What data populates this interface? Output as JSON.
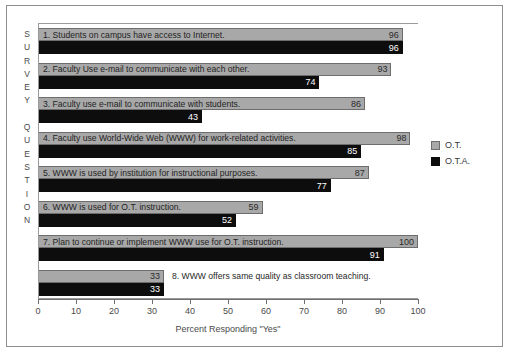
{
  "chart_data": {
    "type": "bar",
    "orientation": "horizontal",
    "title": "",
    "xlabel": "Percent Responding \"Yes\"",
    "ylabel": "SURVEY QUESTION",
    "xlim": [
      0,
      100
    ],
    "xticks": [
      0,
      10,
      20,
      30,
      40,
      50,
      60,
      70,
      80,
      90,
      100
    ],
    "grid": false,
    "legend_position": "right",
    "categories": [
      "1. Students on campus have access to Internet.",
      "2. Faculty Use e-mail to communicate with each other.",
      "3. Faculty use e-mail to communicate with students.",
      "4. Faculty use World-Wide Web (WWW) for work-related activities.",
      "5. WWW is used by institution for instructional purposes.",
      "6. WWW is used for O.T. instruction.",
      "7. Plan to continue or implement WWW use for O.T. instruction.",
      "8. WWW offers same quality as classroom teaching."
    ],
    "series": [
      {
        "name": "O.T.",
        "color": "#a8a8a8",
        "values": [
          96,
          93,
          86,
          98,
          87,
          59,
          100,
          33
        ]
      },
      {
        "name": "O.T.A.",
        "color": "#0d0d0d",
        "values": [
          96,
          74,
          43,
          85,
          77,
          52,
          91,
          33
        ]
      }
    ]
  },
  "axis": {
    "y_caption_letters": [
      "S",
      "U",
      "R",
      "V",
      "E",
      "Y",
      "",
      "Q",
      "U",
      "E",
      "S",
      "T",
      "I",
      "O",
      "N"
    ],
    "x_title": "Percent Responding \"Yes\"",
    "x_tick_labels": [
      "0",
      "10",
      "20",
      "30",
      "40",
      "50",
      "60",
      "70",
      "80",
      "90",
      "100"
    ]
  },
  "legend": {
    "items": [
      {
        "label": "O.T.",
        "swatch": "ot"
      },
      {
        "label": "O.T.A.",
        "swatch": "ota"
      }
    ]
  },
  "bars": [
    {
      "index": 0,
      "caption": "1.  Students on campus have access to Internet.",
      "caption_inside": true,
      "ot": 96,
      "ota": 96,
      "ot_label": "96",
      "ota_label": "96"
    },
    {
      "index": 1,
      "caption": "2.  Faculty Use e-mail to communicate with each other.",
      "caption_inside": true,
      "ot": 93,
      "ota": 74,
      "ot_label": "93",
      "ota_label": "74"
    },
    {
      "index": 2,
      "caption": "3.  Faculty use e-mail to communicate with students.",
      "caption_inside": true,
      "ot": 86,
      "ota": 43,
      "ot_label": "86",
      "ota_label": "43"
    },
    {
      "index": 3,
      "caption": "4.  Faculty use World-Wide Web (WWW) for work-related activities.",
      "caption_inside": true,
      "ot": 98,
      "ota": 85,
      "ot_label": "98",
      "ota_label": "85"
    },
    {
      "index": 4,
      "caption": "5.  WWW is used by institution for instructional purposes.",
      "caption_inside": true,
      "ot": 87,
      "ota": 77,
      "ot_label": "87",
      "ota_label": "77"
    },
    {
      "index": 5,
      "caption": "6.  WWW is used for O.T. instruction.",
      "caption_inside": true,
      "ot": 59,
      "ota": 52,
      "ot_label": "59",
      "ota_label": "52"
    },
    {
      "index": 6,
      "caption": "7.  Plan to continue or implement WWW use for O.T. instruction.",
      "caption_inside": true,
      "ot": 100,
      "ota": 91,
      "ot_label": "100",
      "ota_label": "91"
    },
    {
      "index": 7,
      "caption": "8.  WWW offers same quality as classroom teaching.",
      "caption_inside": false,
      "ot": 33,
      "ota": 33,
      "ot_label": "33",
      "ota_label": "33"
    }
  ]
}
